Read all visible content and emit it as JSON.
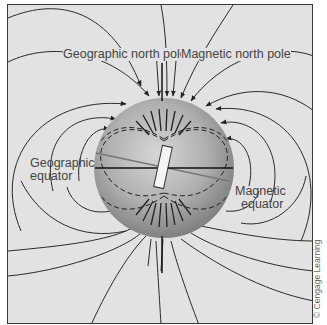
{
  "figure": {
    "type": "earth-magnetic-field-diagram",
    "labels": {
      "geographic_north_pole": "Geographic north pole",
      "magnetic_north_pole": "Magnetic north pole",
      "geographic_equator_line1": "Geographic",
      "geographic_equator_line2": "equator",
      "magnetic_equator_line1": "Magnetic",
      "magnetic_equator_line2": "equator"
    },
    "credit": "© Cengage Learning",
    "colors": {
      "background": "#e2e2e2",
      "field_lines": "#2a2a2a",
      "sphere_light": "#c9c9c9",
      "sphere_dark": "#7e7e7e",
      "magnet_fill": "#f4f4f4"
    }
  }
}
